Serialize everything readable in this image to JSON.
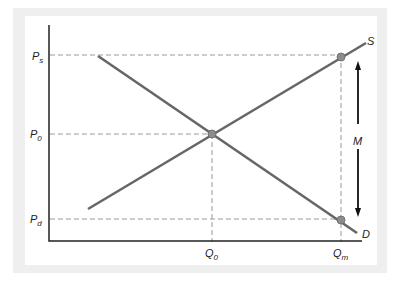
{
  "diagram": {
    "type": "supply-demand",
    "title": "",
    "curves": [
      {
        "name": "S",
        "label": "S",
        "kind": "supply"
      },
      {
        "name": "D",
        "label": "D",
        "kind": "demand"
      }
    ],
    "y_labels": {
      "ps": {
        "main": "P",
        "sub": "s"
      },
      "p0": {
        "main": "P",
        "sub": "0"
      },
      "pd": {
        "main": "P",
        "sub": "d"
      }
    },
    "x_labels": {
      "q0": {
        "main": "Q",
        "sub": "0"
      },
      "qm": {
        "main": "Q",
        "sub": "m"
      }
    },
    "arrow_label": "M",
    "colors": {
      "curve": "#666666",
      "axis": "#222222",
      "dash": "#999999",
      "point": "#888888",
      "background": "#f0f0f0"
    }
  }
}
